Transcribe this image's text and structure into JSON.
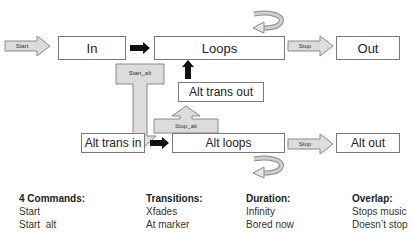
{
  "diagram": {
    "states": {
      "in": "In",
      "loops": "Loops",
      "out": "Out",
      "alt_trans_out": "Alt trans out",
      "alt_trans_in": "Alt trans in",
      "alt_loops": "Alt loops",
      "alt_out": "Alt out"
    },
    "commands": {
      "start": "Start",
      "stop": "Stop",
      "start_alt": "Start_alt",
      "stop_alt": "Stop_alt",
      "stop_lower": "Stop"
    },
    "colors": {
      "command_fill": "#dcdcdc",
      "border": "#7a7a7a",
      "black_arrow": "#111111"
    }
  },
  "legend": {
    "columns": [
      {
        "heading": "4 Commands:",
        "items": [
          "Start",
          "Start  alt"
        ]
      },
      {
        "heading": "Transitions:",
        "items": [
          "Xfades",
          "At marker"
        ]
      },
      {
        "heading": "Duration:",
        "items": [
          "Infinity",
          "Bored now"
        ]
      },
      {
        "heading": "Overlap:",
        "items": [
          "Stops music",
          "Doesn’t stop"
        ]
      }
    ]
  }
}
